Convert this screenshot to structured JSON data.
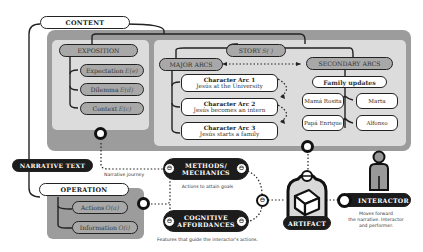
{
  "diagram": {
    "content": {
      "label": "CONTENT"
    },
    "exposition": {
      "label": "EXPOSITION",
      "items": [
        {
          "label": "Expectation",
          "symbol": "E(e)"
        },
        {
          "label": "Dilemma",
          "symbol": "E(d)"
        },
        {
          "label": "Context",
          "symbol": "E(c)"
        }
      ]
    },
    "story": {
      "label": "STORY",
      "symbol": "S( )"
    },
    "major_arcs": {
      "label": "MAJOR ARCS",
      "items": [
        {
          "title": "Character Arc 1",
          "subtitle": "Jesús at the University"
        },
        {
          "title": "Character Arc 2",
          "subtitle": "Jesús becomes an intern"
        },
        {
          "title": "Character Arc 3",
          "subtitle": "Jesús starts a family"
        }
      ]
    },
    "secondary_arcs": {
      "label": "SECONDARY ARCS",
      "family_updates": "Family updates",
      "members": [
        "Mamá Rosita",
        "Marta",
        "Papá Enrique",
        "Alfonso"
      ]
    },
    "narrative_text": {
      "label": "NARRATIVE TEXT",
      "caption": "Narrative journey"
    },
    "operation": {
      "label": "OPERATION",
      "items": [
        {
          "label": "Actions",
          "symbol": "O(a)"
        },
        {
          "label": "Information",
          "symbol": "O(i)"
        }
      ]
    },
    "methods": {
      "line1": "METHODS/",
      "line2": "MECHANICS",
      "caption": "Actions to attain goals"
    },
    "cognitive": {
      "line1": "COGNITIVE",
      "line2": "AFFORDANCES",
      "caption": "Features that guide the interactor's actions."
    },
    "artifact": {
      "label": "ARTIFACT"
    },
    "interactor": {
      "label": "INTERACTOR",
      "caption_1": "Moves forward",
      "caption_2": "the narrative. Interactor",
      "caption_3": "and performer."
    },
    "colors": {
      "dark": "#1c1c1c",
      "panel_dark": "#9c9c9c",
      "panel_light": "#dcdcdc",
      "pill_grey": "#a8a8a8"
    }
  }
}
